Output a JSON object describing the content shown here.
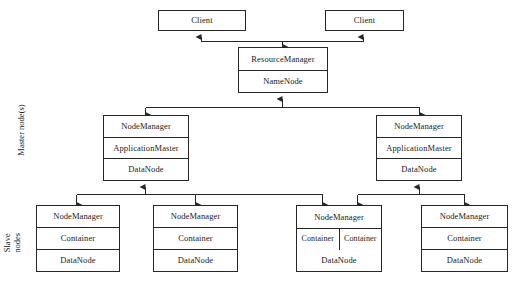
{
  "diagram": {
    "side_labels": {
      "master": "Master node(s)",
      "slave_line1": "Slave",
      "slave_line2": "nodes"
    },
    "colors": {
      "stroke": "#262626",
      "text": "#1a1a1a",
      "background": "#ffffff"
    },
    "clients": [
      {
        "label": "Client"
      },
      {
        "label": "Client"
      }
    ],
    "master": {
      "resource_manager": {
        "rows": [
          "ResourceManager",
          "NameNode"
        ]
      },
      "node_managers": [
        {
          "rows": [
            "NodeManager",
            "ApplicationMaster",
            "DataNode"
          ]
        },
        {
          "rows": [
            "NodeManager",
            "ApplicationMaster",
            "DataNode"
          ]
        }
      ]
    },
    "slaves": [
      {
        "header": "NodeManager",
        "containers": [
          "Container"
        ],
        "footer": "DataNode"
      },
      {
        "header": "NodeManager",
        "containers": [
          "Container"
        ],
        "footer": "DataNode"
      },
      {
        "header": "NodeManager",
        "containers": [
          "Container",
          "Container"
        ],
        "footer": "DataNode"
      },
      {
        "header": "NodeManager",
        "containers": [
          "Container"
        ],
        "footer": "DataNode"
      }
    ]
  }
}
